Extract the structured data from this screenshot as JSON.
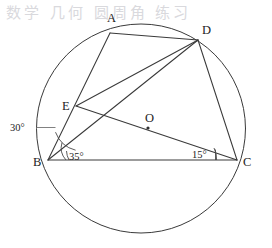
{
  "figure": {
    "kind": "circle-geometry-diagram",
    "watermark_text": "数学 几何 圆周角 练习",
    "circle": {
      "center_label": "O",
      "center_x": 141,
      "center_y": 128.5,
      "radius": 104.5
    },
    "points": [
      {
        "label": "A",
        "x": 110,
        "y": 33,
        "label_x": 107,
        "label_y": 22
      },
      {
        "label": "D",
        "x": 198,
        "y": 40,
        "label_x": 202,
        "label_y": 34
      },
      {
        "label": "E",
        "x": 76,
        "y": 106,
        "label_x": 62,
        "label_y": 110
      },
      {
        "label": "B",
        "x": 48,
        "y": 160,
        "label_x": 33,
        "label_y": 166
      },
      {
        "label": "C",
        "x": 237,
        "y": 160,
        "label_x": 243,
        "label_y": 166
      },
      {
        "label": "O",
        "x": 148,
        "y": 128,
        "label_x": 145,
        "label_y": 122
      }
    ],
    "segments": [
      {
        "name": "A-D",
        "from": "A",
        "to": "D"
      },
      {
        "name": "A-B",
        "from": "A",
        "to": "B"
      },
      {
        "name": "D-E",
        "from": "D",
        "to": "E"
      },
      {
        "name": "D-B",
        "from": "D",
        "to": "B"
      },
      {
        "name": "D-C",
        "from": "D",
        "to": "C"
      },
      {
        "name": "E-C",
        "from": "E",
        "to": "C"
      },
      {
        "name": "B-C",
        "from": "B",
        "to": "C"
      }
    ],
    "angles": [
      {
        "name": "angle-at-b-outer",
        "value": "30°",
        "label_x": 10,
        "label_y": 131,
        "vertex": "B"
      },
      {
        "name": "angle-at-b-inner",
        "value": "35°",
        "label_x": 69,
        "label_y": 160,
        "vertex": "B"
      },
      {
        "name": "angle-at-c",
        "value": "15°",
        "label_x": 192,
        "label_y": 158,
        "vertex": "C"
      }
    ]
  }
}
